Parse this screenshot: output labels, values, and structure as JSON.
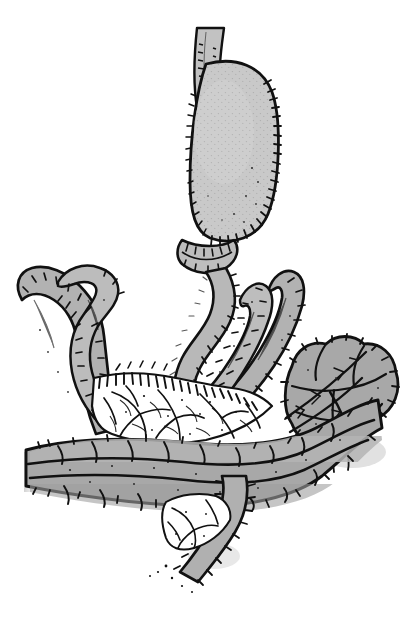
{
  "image": {
    "kind": "line-art-illustration",
    "subject": "Upper gastrointestinal tract anatomy: stomach, duodenum, small bowel loops with mesentery and transverse colon",
    "style": "black-ink pen-and-ink medical illustration with flat gray tonal fill and stippled hatching",
    "background_color": "#ffffff",
    "ink_color": "#000000",
    "width_px": 404,
    "height_px": 618,
    "visible_text": "",
    "signature_text": "",
    "palette": {
      "background": "#ffffff",
      "outline": "#111111",
      "organ_fill_light": "#c9c9c9",
      "organ_fill_mid": "#b2b2b2",
      "organ_fill_dark": "#a3a3a3",
      "mesentery_fill": "#ffffff",
      "shadow": "#d8d8d8"
    },
    "structures": [
      {
        "id": "esophagus",
        "label": "Esophagus",
        "region": "top-center, vertical tube entering from image top edge",
        "fill": "#c2c2c2"
      },
      {
        "id": "stomach-body",
        "label": "Stomach (body and fundus)",
        "region": "upper-center, large ovoid sac",
        "fill": "#c9c9c9"
      },
      {
        "id": "greater-curvature",
        "label": "Greater curvature",
        "region": "right margin of stomach, densely hatched",
        "fill": "#c9c9c9"
      },
      {
        "id": "lesser-curvature",
        "label": "Lesser curvature",
        "region": "left margin of stomach",
        "fill": "#c9c9c9"
      },
      {
        "id": "pylorus",
        "label": "Pylorus / antrum",
        "region": "below stomach, narrowed constricted band",
        "fill": "#bdbdbd"
      },
      {
        "id": "duodenum",
        "label": "Duodenum",
        "region": "center, S-shaped descending tube below pylorus",
        "fill": "#b8b8b8"
      },
      {
        "id": "jejunal-loop-left",
        "label": "Jejunal loop (folded back)",
        "region": "left third, hairpin loop turning upward",
        "fill": "#b2b2b2"
      },
      {
        "id": "jejunal-loop-right",
        "label": "Jejunal loop (ascending)",
        "region": "right of center, hairpin loop turning upward",
        "fill": "#b2b2b2"
      },
      {
        "id": "mesentery",
        "label": "Mesentery with vessels",
        "region": "center, white fan with branching vascular lines",
        "fill": "#ffffff"
      },
      {
        "id": "transverse-colon",
        "label": "Transverse colon",
        "region": "lower half, broad haustrated band crossing horizontally",
        "fill": "#a8a8a8"
      },
      {
        "id": "taenia-coli",
        "label": "Taenia coli",
        "region": "long dark line running along the colon",
        "fill": "#111111"
      },
      {
        "id": "omental-mass",
        "label": "Lobulated omental/colic mass",
        "region": "right side, cauliflower-like clustered lobules",
        "fill": "#a8a8a8"
      },
      {
        "id": "ileal-limb",
        "label": "Distal ileal limb",
        "region": "bottom-center, tapering tube descending off frame",
        "fill": "#b0b0b0"
      }
    ]
  }
}
